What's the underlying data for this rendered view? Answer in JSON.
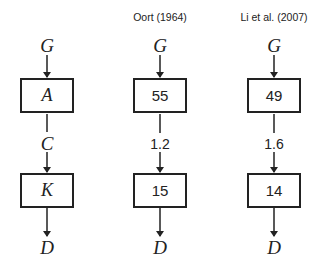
{
  "columns": [
    {
      "title": "",
      "input": "G",
      "box1": "A",
      "middle": "C",
      "box2": "K",
      "output": "D"
    },
    {
      "title": "Oort (1964)",
      "input": "G",
      "box1": "55",
      "middle": "1.2",
      "box2": "15",
      "output": "D"
    },
    {
      "title": "Li et al. (2007)",
      "input": "G",
      "box1": "49",
      "middle": "1.6",
      "box2": "14",
      "output": "D"
    }
  ]
}
